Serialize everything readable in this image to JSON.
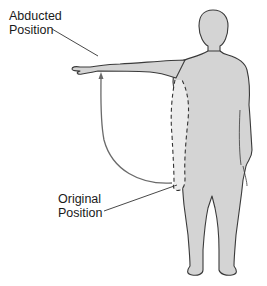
{
  "diagram": {
    "labels": {
      "abducted": {
        "line1": "Abducted",
        "line2": "Position"
      },
      "original": {
        "line1": "Original",
        "line2": "Position"
      }
    },
    "colors": {
      "body_fill": "#d4d4d4",
      "outline": "#3a3a3a",
      "arrow": "#6a6a6a",
      "leader": "#333333",
      "background": "#ffffff"
    }
  }
}
